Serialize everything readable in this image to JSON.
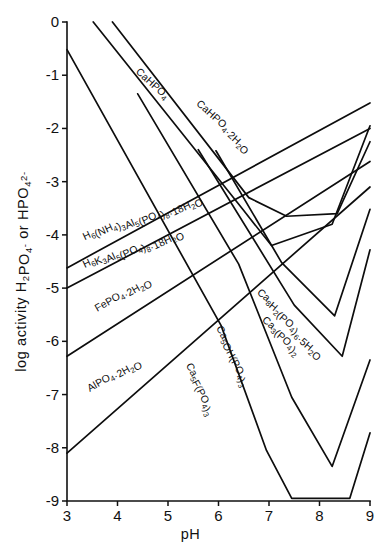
{
  "chart_data": {
    "type": "line",
    "title": "",
    "xlabel": "pH",
    "ylabel": "log activity H2PO4- or HPO4 2-",
    "ylabel_parts": [
      {
        "t": "log activity H",
        "k": "base"
      },
      {
        "t": "2",
        "k": "sub"
      },
      {
        "t": "PO",
        "k": "base"
      },
      {
        "t": "4",
        "k": "sub"
      },
      {
        "t": "-",
        "k": "sup"
      },
      {
        "t": " or HPO",
        "k": "base"
      },
      {
        "t": "4",
        "k": "sub"
      },
      {
        "t": "2-",
        "k": "sup"
      }
    ],
    "xlim": [
      3,
      9
    ],
    "ylim": [
      -9,
      0
    ],
    "xticks": [
      3,
      4,
      5,
      6,
      7,
      8,
      9
    ],
    "xticklabels": [
      "3",
      "4",
      "5",
      "6",
      "7",
      "8",
      "9"
    ],
    "yticks": [
      0,
      -1,
      -2,
      -3,
      -4,
      -5,
      -6,
      -7,
      -8,
      -9
    ],
    "yticklabels": [
      "0",
      "-1",
      "-2",
      "-3",
      "-4",
      "-5",
      "-6",
      "-7",
      "-8",
      "-9"
    ],
    "grid": false,
    "legend": "inline-labels",
    "series": [
      {
        "name": "CaHPO4",
        "label_parts": [
          {
            "t": "CaHPO",
            "k": "base"
          },
          {
            "t": "4",
            "k": "sub"
          }
        ],
        "label_x": 4.35,
        "label_y": -0.95,
        "label_rotate": 42,
        "points": [
          [
            3.52,
            0.0
          ],
          [
            6.48,
            -3.52
          ],
          [
            7.05,
            -4.2
          ],
          [
            8.25,
            -3.8
          ],
          [
            9.0,
            -1.95
          ]
        ]
      },
      {
        "name": "CaHPO4.2H2O",
        "label_parts": [
          {
            "t": "CaHPO",
            "k": "base"
          },
          {
            "t": "4",
            "k": "sub"
          },
          {
            "t": "·2H",
            "k": "base"
          },
          {
            "t": "2",
            "k": "sub"
          },
          {
            "t": "O",
            "k": "base"
          }
        ],
        "label_x": 5.55,
        "label_y": -1.55,
        "label_rotate": 42,
        "points": [
          [
            3.9,
            0.0
          ],
          [
            6.6,
            -3.3
          ],
          [
            7.35,
            -3.65
          ],
          [
            8.35,
            -3.6
          ],
          [
            9.0,
            -2.25
          ]
        ]
      },
      {
        "name": "H6(NH4)3Al5(PO4)8.18H2O",
        "label_parts": [
          {
            "t": "H",
            "k": "base"
          },
          {
            "t": "6",
            "k": "sub"
          },
          {
            "t": "(NH",
            "k": "base"
          },
          {
            "t": "4",
            "k": "sub"
          },
          {
            "t": ")",
            "k": "base"
          },
          {
            "t": "3",
            "k": "sub"
          },
          {
            "t": "Al",
            "k": "base"
          },
          {
            "t": "5",
            "k": "sub"
          },
          {
            "t": "(PO",
            "k": "base"
          },
          {
            "t": "4",
            "k": "sub"
          },
          {
            "t": ")",
            "k": "base"
          },
          {
            "t": "8",
            "k": "sub"
          },
          {
            "t": "·18H",
            "k": "base"
          },
          {
            "t": "2",
            "k": "sub"
          },
          {
            "t": "O",
            "k": "base"
          }
        ],
        "label_x": 3.35,
        "label_y": -4.1,
        "label_rotate": -25,
        "points": [
          [
            3.0,
            -4.62
          ],
          [
            9.0,
            -1.52
          ]
        ]
      },
      {
        "name": "H6K3Al5(PO4)8.18H2O",
        "label_parts": [
          {
            "t": "H",
            "k": "base"
          },
          {
            "t": "6",
            "k": "sub"
          },
          {
            "t": "K",
            "k": "base"
          },
          {
            "t": "3",
            "k": "sub"
          },
          {
            "t": "Al",
            "k": "base"
          },
          {
            "t": "5",
            "k": "sub"
          },
          {
            "t": "(PO",
            "k": "base"
          },
          {
            "t": "4",
            "k": "sub"
          },
          {
            "t": ")",
            "k": "base"
          },
          {
            "t": "8",
            "k": "sub"
          },
          {
            "t": "·18H",
            "k": "base"
          },
          {
            "t": "2",
            "k": "sub"
          },
          {
            "t": "O",
            "k": "base"
          }
        ],
        "label_x": 3.35,
        "label_y": -4.62,
        "label_rotate": -25,
        "points": [
          [
            3.0,
            -5.0
          ],
          [
            9.0,
            -2.0
          ]
        ]
      },
      {
        "name": "FePO4.2H2O",
        "label_parts": [
          {
            "t": "FePO",
            "k": "base"
          },
          {
            "t": "4",
            "k": "sub"
          },
          {
            "t": "·2H",
            "k": "base"
          },
          {
            "t": "2",
            "k": "sub"
          },
          {
            "t": "O",
            "k": "base"
          }
        ],
        "label_x": 3.6,
        "label_y": -5.45,
        "label_rotate": -30,
        "points": [
          [
            3.0,
            -6.28
          ],
          [
            9.0,
            -2.62
          ]
        ]
      },
      {
        "name": "AlPO4.2H2O",
        "label_parts": [
          {
            "t": "AlPO",
            "k": "base"
          },
          {
            "t": "4",
            "k": "sub"
          },
          {
            "t": "·2H",
            "k": "base"
          },
          {
            "t": "2",
            "k": "sub"
          },
          {
            "t": "O",
            "k": "base"
          }
        ],
        "label_x": 3.45,
        "label_y": -6.95,
        "label_rotate": -30,
        "points": [
          [
            3.0,
            -8.1
          ],
          [
            9.0,
            -3.1
          ]
        ]
      },
      {
        "name": "Ca8H2(PO4)6.5H2O",
        "label_parts": [
          {
            "t": "Ca",
            "k": "base"
          },
          {
            "t": "8",
            "k": "sub"
          },
          {
            "t": "H",
            "k": "base"
          },
          {
            "t": "2",
            "k": "sub"
          },
          {
            "t": "(PO",
            "k": "base"
          },
          {
            "t": "4",
            "k": "sub"
          },
          {
            "t": ")",
            "k": "base"
          },
          {
            "t": "6",
            "k": "sub"
          },
          {
            "t": "·5H",
            "k": "base"
          },
          {
            "t": "2",
            "k": "sub"
          },
          {
            "t": "O",
            "k": "base"
          }
        ],
        "label_x": 6.75,
        "label_y": -5.1,
        "label_rotate": 40,
        "points": [
          [
            5.95,
            -2.42
          ],
          [
            7.25,
            -4.52
          ],
          [
            8.3,
            -5.52
          ],
          [
            9.0,
            -3.52
          ]
        ]
      },
      {
        "name": "Ca3(PO4)2",
        "label_parts": [
          {
            "t": "Ca",
            "k": "base"
          },
          {
            "t": "3",
            "k": "sub"
          },
          {
            "t": "(PO",
            "k": "base"
          },
          {
            "t": "4",
            "k": "sub"
          },
          {
            "t": ")",
            "k": "base"
          },
          {
            "t": "2",
            "k": "sub"
          }
        ],
        "label_x": 6.85,
        "label_y": -5.62,
        "label_rotate": 40,
        "points": [
          [
            5.6,
            -2.4
          ],
          [
            7.5,
            -5.32
          ],
          [
            8.45,
            -6.28
          ],
          [
            9.0,
            -4.28
          ]
        ]
      },
      {
        "name": "Ca5OH(PO4)3",
        "label_parts": [
          {
            "t": "Ca",
            "k": "base"
          },
          {
            "t": "5",
            "k": "sub"
          },
          {
            "t": "OH(PO",
            "k": "base"
          },
          {
            "t": "4",
            "k": "sub"
          },
          {
            "t": ")",
            "k": "base"
          },
          {
            "t": "3",
            "k": "sub"
          }
        ],
        "label_x": 5.95,
        "label_y": -5.75,
        "label_rotate": 62,
        "points": [
          [
            4.4,
            -1.35
          ],
          [
            6.4,
            -4.55
          ],
          [
            7.45,
            -7.05
          ],
          [
            8.25,
            -8.35
          ],
          [
            9.0,
            -6.35
          ]
        ]
      },
      {
        "name": "Ca5F(PO4)3",
        "label_parts": [
          {
            "t": "Ca",
            "k": "base"
          },
          {
            "t": "5",
            "k": "sub"
          },
          {
            "t": "F(PO",
            "k": "base"
          },
          {
            "t": "4",
            "k": "sub"
          },
          {
            "t": ")",
            "k": "base"
          },
          {
            "t": "3",
            "k": "sub"
          }
        ],
        "label_x": 5.35,
        "label_y": -6.45,
        "label_rotate": 62,
        "points": [
          [
            3.0,
            -0.52
          ],
          [
            6.05,
            -5.7
          ],
          [
            6.95,
            -8.05
          ],
          [
            7.45,
            -8.95
          ],
          [
            8.6,
            -8.95
          ],
          [
            9.0,
            -7.72
          ]
        ]
      }
    ]
  }
}
